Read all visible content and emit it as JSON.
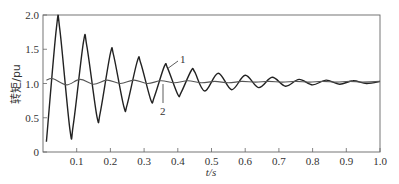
{
  "chart_data": {
    "type": "line",
    "title": "",
    "xlabel": "t/s",
    "ylabel": "转矩/pu",
    "xlim": [
      0,
      1.0
    ],
    "ylim": [
      0,
      2.0
    ],
    "grid": false,
    "legend": "inline numeric labels (1, 2) with leader lines",
    "x_ticks": [
      "0.1",
      "0.2",
      "0.3",
      "0.4",
      "0.5",
      "0.6",
      "0.7",
      "0.8",
      "0.9",
      "1.0"
    ],
    "y_ticks": [
      "0",
      "0.5",
      "1.0",
      "1.5",
      "2.0"
    ],
    "series": [
      {
        "name": "1",
        "color": "#222222",
        "x": [
          0.01,
          0.04,
          0.05,
          0.08,
          0.09,
          0.12,
          0.13,
          0.16,
          0.17,
          0.2,
          0.21,
          0.24,
          0.25,
          0.28,
          0.29,
          0.32,
          0.33,
          0.36,
          0.37,
          0.4,
          0.41,
          0.44,
          0.45,
          0.48,
          0.52,
          0.56,
          0.6,
          0.64,
          0.68,
          0.72,
          0.76,
          0.8,
          0.84,
          0.88,
          0.92,
          0.96,
          1.0
        ],
        "y": [
          0.15,
          1.82,
          1.78,
          0.32,
          0.4,
          1.6,
          1.55,
          0.52,
          0.58,
          1.44,
          1.4,
          0.66,
          0.7,
          1.33,
          1.3,
          0.76,
          0.8,
          1.25,
          1.22,
          0.84,
          0.87,
          1.19,
          1.17,
          0.89,
          1.15,
          0.91,
          1.12,
          0.94,
          1.09,
          0.96,
          1.06,
          0.98,
          1.05,
          0.99,
          1.04,
          1.0,
          1.03
        ]
      },
      {
        "name": "2",
        "color": "#555555",
        "x": [
          0.01,
          0.03,
          0.07,
          0.11,
          0.15,
          0.19,
          0.23,
          0.27,
          0.31,
          0.35,
          0.39,
          0.43,
          0.47,
          0.51,
          0.55,
          0.59,
          0.63,
          0.67,
          0.71,
          0.75,
          0.79,
          0.83,
          0.87,
          0.91,
          0.95,
          1.0
        ],
        "y": [
          1.05,
          1.07,
          0.98,
          1.06,
          0.99,
          1.05,
          1.0,
          1.05,
          1.0,
          1.04,
          1.01,
          1.04,
          1.01,
          1.03,
          1.01,
          1.03,
          1.02,
          1.03,
          1.02,
          1.03,
          1.02,
          1.03,
          1.02,
          1.03,
          1.02,
          1.03
        ]
      }
    ],
    "annotations": [
      {
        "text": "1",
        "points_to_series": "1",
        "near_t": 0.36
      },
      {
        "text": "2",
        "points_to_series": "2",
        "near_t": 0.35
      }
    ]
  }
}
